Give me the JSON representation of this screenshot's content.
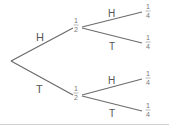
{
  "diagram": {
    "type": "probability-tree",
    "root": {
      "branches": [
        {
          "label": "H",
          "probability": {
            "num": "1",
            "den": "2"
          },
          "children": [
            {
              "label": "H",
              "probability": {
                "num": "1",
                "den": "4"
              }
            },
            {
              "label": "T",
              "probability": {
                "num": "1",
                "den": "4"
              }
            }
          ]
        },
        {
          "label": "T",
          "probability": {
            "num": "1",
            "den": "2"
          },
          "children": [
            {
              "label": "H",
              "probability": {
                "num": "1",
                "den": "4"
              }
            },
            {
              "label": "T",
              "probability": {
                "num": "1",
                "den": "4"
              }
            }
          ]
        }
      ]
    },
    "colors": {
      "line": "#6a6a6a",
      "text": "#555555",
      "rule": "#d0d0d0"
    }
  }
}
